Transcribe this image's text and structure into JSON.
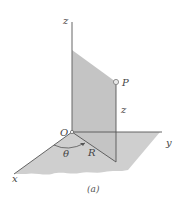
{
  "figure": {
    "caption": "(a)",
    "labels": {
      "z_axis": "z",
      "y_axis": "y",
      "x_axis": "x",
      "origin": "O",
      "point": "P",
      "height": "z",
      "angle": "θ",
      "radius": "R"
    },
    "colors": {
      "shade": "#c9c9c9",
      "shade_dark": "#bdbdbd",
      "line": "#555555",
      "text": "#444444"
    }
  }
}
